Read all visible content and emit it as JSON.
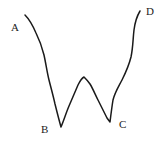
{
  "diagram": {
    "type": "w-shaped curve",
    "stroke_color": "#1a1a1a",
    "path": "M25,15 C30,20 33,26 36,33 C40,41 42,47 44,55 C46,64 47,72 49,80 C51,88 53,95 55,104 C57,112 59,120 61,127 C64,120 66,113 69,106 C72,99 75,92 78,85 C80,81 82,78 84,77 C86,79 88,81 90,84 C93,89 95,94 98,100 C101,106 104,112 107,118 L110,122 C111,114 112,106 113,100 C115,92 119,86 122,80 C126,72 129,65 131,57 C133,48 133,38 134,30 C135,22 137,16 140,11",
    "labels": [
      {
        "id": "A",
        "text": "A",
        "x": 11,
        "y": 22
      },
      {
        "id": "B",
        "text": "B",
        "x": 41,
        "y": 124
      },
      {
        "id": "C",
        "text": "C",
        "x": 119,
        "y": 119
      },
      {
        "id": "D",
        "text": "D",
        "x": 146,
        "y": 6
      }
    ]
  }
}
